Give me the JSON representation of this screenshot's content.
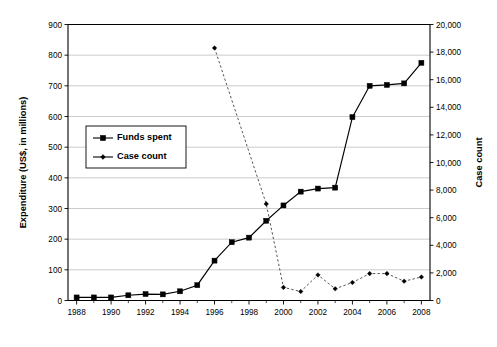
{
  "chart_data": {
    "type": "line",
    "title": "",
    "xlabel": "",
    "ylabel": "Expenditure (US$, in millions)",
    "y2label": "Case count",
    "grid": true,
    "legend_position": "upper-left",
    "xlim": [
      1987.5,
      2008.5
    ],
    "ylim": [
      0,
      900
    ],
    "y2lim": [
      0,
      20000
    ],
    "x": [
      1988,
      1989,
      1990,
      1991,
      1992,
      1993,
      1994,
      1995,
      1996,
      1997,
      1998,
      1999,
      2000,
      2001,
      2002,
      2003,
      2004,
      2005,
      2006,
      2007,
      2008
    ],
    "xtick_labels": [
      "1988",
      "1990",
      "1992",
      "1994",
      "1996",
      "1998",
      "2000",
      "2002",
      "2004",
      "2006",
      "2008"
    ],
    "xtick_values": [
      1988,
      1990,
      1992,
      1994,
      1996,
      1998,
      2000,
      2002,
      2004,
      2006,
      2008
    ],
    "ytick_labels": [
      "0",
      "100",
      "200",
      "300",
      "400",
      "500",
      "600",
      "700",
      "800",
      "900"
    ],
    "ytick_values": [
      0,
      100,
      200,
      300,
      400,
      500,
      600,
      700,
      800,
      900
    ],
    "y2tick_labels": [
      "0",
      "2,000",
      "4,000",
      "6,000",
      "8,000",
      "10,000",
      "12,000",
      "14,000",
      "16,000",
      "18,000",
      "20,000"
    ],
    "y2tick_values": [
      0,
      2000,
      4000,
      6000,
      8000,
      10000,
      12000,
      14000,
      16000,
      18000,
      20000
    ],
    "series": [
      {
        "name": "Funds spent",
        "axis": "left",
        "marker": "square",
        "linestyle": "solid",
        "color": "#000000",
        "x": [
          1988,
          1989,
          1990,
          1991,
          1992,
          1993,
          1994,
          1995,
          1996,
          1997,
          1998,
          1999,
          2000,
          2001,
          2002,
          2003,
          2004,
          2005,
          2006,
          2007,
          2008
        ],
        "values": [
          10,
          10,
          10,
          17,
          21,
          20,
          30,
          50,
          130,
          190,
          205,
          260,
          310,
          355,
          365,
          368,
          598,
          700,
          703,
          708,
          775
        ]
      },
      {
        "name": "Case count",
        "axis": "right",
        "marker": "diamond",
        "linestyle": "dashed",
        "color": "#555555",
        "x": [
          1996,
          1999,
          2000,
          2001,
          2002,
          2003,
          2004,
          2005,
          2006,
          2007,
          2008
        ],
        "values": [
          18300,
          7000,
          950,
          650,
          1850,
          850,
          1300,
          1950,
          1950,
          1400,
          1700
        ]
      }
    ]
  },
  "legend": {
    "entries": [
      {
        "label": "Funds spent"
      },
      {
        "label": "Case count"
      }
    ]
  },
  "axes": {
    "left_title": "Expenditure (US$, in millions)",
    "right_title": "Case count"
  }
}
